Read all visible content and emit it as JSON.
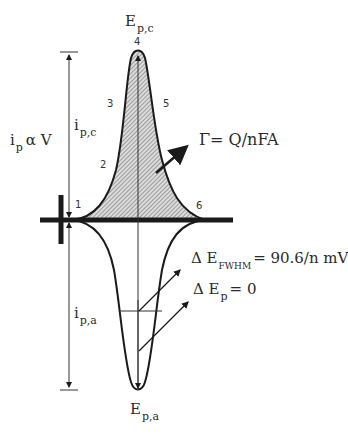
{
  "diagram": {
    "type": "thin-layer cyclic voltammogram (surface-confined redox)",
    "cathodic_peak": {
      "label_main": "E",
      "label_sub": "p,c",
      "current_label_main": "i",
      "current_label_sub": "p,c"
    },
    "anodic_peak": {
      "label_main": "E",
      "label_sub": "p,a",
      "current_label_main": "i",
      "current_label_sub": "p,a"
    },
    "proportionality": {
      "main": "i",
      "sub": "p",
      "rest": "α V"
    },
    "surface_coverage": {
      "text": "Γ= Q/nFA"
    },
    "fwhm": {
      "prefix": "Δ E",
      "sub": "FWHM",
      "rest": "= 90.6/n mV"
    },
    "peak_separation": {
      "prefix": "Δ E",
      "sub": "p",
      "rest": "= 0"
    },
    "point_labels": [
      "1",
      "2",
      "3",
      "4",
      "5",
      "6"
    ],
    "colors": {
      "line": "#1a1a1a",
      "hatch": "#555555",
      "fill": "#d9d9d9",
      "background": "#ffffff"
    }
  }
}
